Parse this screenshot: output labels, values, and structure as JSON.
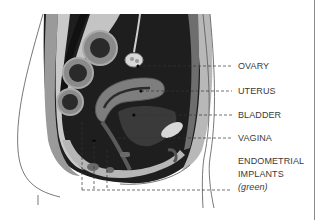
{
  "figure": {
    "colors": {
      "background": "#ffffff",
      "cavity_dark": "#1e1e1e",
      "tissue_mid": "#8c8c8c",
      "tissue_light": "#bdbdbd",
      "fat_light": "#d4d4d4",
      "organ_gray": "#7a7a7a",
      "outline": "#444444",
      "leader_line": "#333333",
      "label_text": "#3a3a3a"
    }
  },
  "labels": [
    {
      "id": "ovary",
      "text": "OVARY",
      "y": 66,
      "leader_from_x": 185
    },
    {
      "id": "uterus",
      "text": "UTERUS",
      "y": 91,
      "leader_from_x": 190
    },
    {
      "id": "bladder",
      "text": "BLADDER",
      "y": 115,
      "leader_from_x": 170
    },
    {
      "id": "vagina",
      "text": "VAGINA",
      "y": 138,
      "leader_from_x": 150
    },
    {
      "id": "endometrial",
      "text": "ENDOMETRIAL",
      "y": 161
    },
    {
      "id": "implants",
      "text": "IMPLANTS",
      "y": 174
    },
    {
      "id": "green",
      "text": "(green)",
      "y": 187,
      "italic": true,
      "leader_from_x": 82
    }
  ]
}
